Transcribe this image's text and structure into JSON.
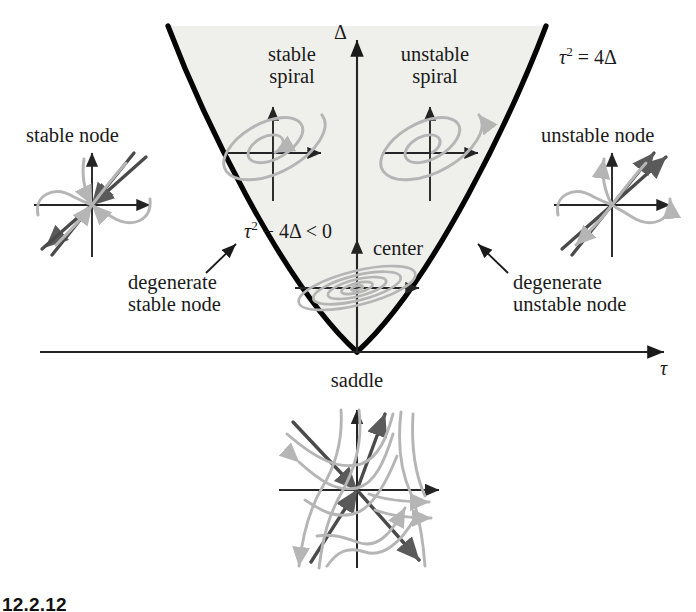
{
  "figure": {
    "axes": {
      "x_label": "τ",
      "y_label": "Δ",
      "x_axis_y": 352,
      "y_axis_x": 357,
      "x_axis_from": 40,
      "x_axis_to": 668,
      "y_axis_top": 36,
      "y_axis_bottom": 352
    },
    "curve": {
      "label": "τ² = 4Δ",
      "equation_html": "<i>τ</i><sup>2</sup> = 4Δ",
      "vertex": [
        357,
        352
      ],
      "opens": "up",
      "description": "parabola tau squared equals four Delta"
    },
    "region": {
      "label": "τ² − 4Δ < 0",
      "equation_html": "<i>τ</i><sup>2</sup> − 4Δ < 0",
      "fill_color": "#efefec",
      "description": "complex eigenvalues region inside the parabola"
    },
    "labels": [
      {
        "name": "stable-spiral",
        "text": "stable\nspiral",
        "lines": [
          "stable",
          "spiral"
        ],
        "x": 292,
        "y": 56
      },
      {
        "name": "unstable-spiral",
        "text": "unstable\nspiral",
        "lines": [
          "unstable",
          "spiral"
        ],
        "x": 432,
        "y": 56
      },
      {
        "name": "stable-node",
        "text": "stable node",
        "lines": [
          "stable node"
        ],
        "x": 78,
        "y": 135
      },
      {
        "name": "unstable-node",
        "text": "unstable node",
        "lines": [
          "unstable node"
        ],
        "x": 615,
        "y": 135
      },
      {
        "name": "center",
        "text": "center",
        "lines": [
          "center"
        ],
        "x": 402,
        "y": 250
      },
      {
        "name": "degenerate-stable-node",
        "text": "degenerate\nstable node",
        "lines": [
          "degenerate",
          "stable node"
        ],
        "x": 186,
        "y": 284
      },
      {
        "name": "degenerate-unstable-node",
        "text": "degenerate\nunstable node",
        "lines": [
          "degenerate",
          "unstable node"
        ],
        "x": 530,
        "y": 284
      },
      {
        "name": "saddle",
        "text": "saddle",
        "lines": [
          "saddle"
        ],
        "x": 357,
        "y": 382
      },
      {
        "name": "curve-equation",
        "text": "τ² = 4Δ",
        "lines": [
          "τ² = 4Δ"
        ],
        "x": 612,
        "y": 56
      },
      {
        "name": "region-inequality",
        "text": "τ² − 4Δ < 0",
        "lines": [
          "τ² − 4Δ < 0"
        ],
        "x": 292,
        "y": 229
      }
    ],
    "portraits": [
      {
        "name": "stable-node-portrait",
        "cx": 92,
        "cy": 205,
        "kind": "node",
        "stability": "stable"
      },
      {
        "name": "unstable-node-portrait",
        "cx": 612,
        "cy": 205,
        "kind": "node",
        "stability": "unstable"
      },
      {
        "name": "stable-spiral-portrait",
        "cx": 273,
        "cy": 153,
        "kind": "spiral",
        "stability": "stable"
      },
      {
        "name": "unstable-spiral-portrait",
        "cx": 430,
        "cy": 153,
        "kind": "spiral",
        "stability": "unstable"
      },
      {
        "name": "center-portrait",
        "cx": 357,
        "cy": 288,
        "kind": "center",
        "stability": "neutral"
      },
      {
        "name": "saddle-portrait",
        "cx": 357,
        "cy": 490,
        "kind": "saddle",
        "stability": "unstable"
      }
    ],
    "pointers": [
      {
        "name": "degenerate-stable-pointer",
        "from": [
          205,
          272
        ],
        "to": [
          233,
          245
        ]
      },
      {
        "name": "degenerate-unstable-pointer",
        "from": [
          508,
          272
        ],
        "to": [
          481,
          245
        ]
      }
    ],
    "colors": {
      "axis": "#222222",
      "curve": "#050505",
      "region_fill": "#efefec",
      "trajectory_light": "#b5b5b5",
      "trajectory_dark": "#4a4a4a",
      "text": "#111111"
    },
    "caption": "12.2.12"
  }
}
